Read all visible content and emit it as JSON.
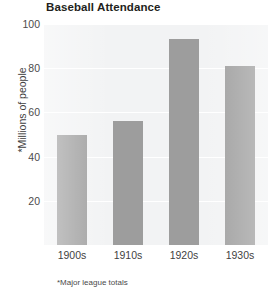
{
  "chart_data": {
    "type": "bar",
    "title": "Baseball Attendance",
    "xlabel": "",
    "ylabel": "*Millions of people",
    "categories": [
      "1900s",
      "1910s",
      "1920s",
      "1930s"
    ],
    "values": [
      50,
      56,
      93,
      81
    ],
    "series": [
      {
        "name": "Baseball Attendance",
        "values": [
          50,
          56,
          93,
          81
        ]
      }
    ],
    "ylim": [
      0,
      100
    ],
    "yticks": [
      20,
      40,
      60,
      80,
      100
    ],
    "ytick_labels": [
      "20",
      "40",
      "60",
      "80",
      "100"
    ],
    "grid": true,
    "legend": false,
    "legend_position": "none",
    "footnote": "*Major league totals",
    "bar_color": "#9d9d9d",
    "plot_background": "#f2f3f4",
    "gridline_color": "#ffffff",
    "text_color": "#3f3f3f",
    "title_color": "#231f20"
  }
}
